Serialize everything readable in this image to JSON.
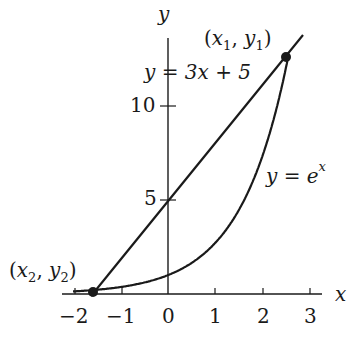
{
  "chart_data": {
    "type": "line",
    "title": "",
    "xlabel": "x",
    "ylabel": "y",
    "xlim": [
      -2.2,
      3.3
    ],
    "ylim": [
      0,
      13.5
    ],
    "x_ticks": [
      -2,
      -1,
      0,
      1,
      2,
      3
    ],
    "y_ticks": [
      5,
      10
    ],
    "grid": false,
    "series": [
      {
        "name": "y = 3x + 5",
        "equation": "3x+5",
        "x_range": [
          -1.6,
          2.8
        ]
      },
      {
        "name": "y = e^x",
        "equation": "exp(x)",
        "x_range": [
          -2.0,
          2.55
        ]
      }
    ],
    "points": [
      {
        "label": "(x1, y1)",
        "x": 2.48,
        "y": 12.44
      },
      {
        "label": "(x2, y2)",
        "x": -1.58,
        "y": 0.26
      }
    ],
    "colors": {
      "ink": "#1a1a1a"
    }
  },
  "labels": {
    "x_axis": "x",
    "y_axis": "y",
    "tick_x": [
      "−2",
      "−1",
      "0",
      "1",
      "2",
      "3"
    ],
    "tick_y5": "5",
    "tick_y10": "10",
    "line_eq": "y = 3x + 5",
    "exp_eq_base": "y = e",
    "exp_eq_sup": "x",
    "p1_x": "x",
    "p1_xs": "1",
    "p1_y": "y",
    "p1_ys": "1",
    "p2_x": "x",
    "p2_xs": "2",
    "p2_y": "y",
    "p2_ys": "2"
  }
}
